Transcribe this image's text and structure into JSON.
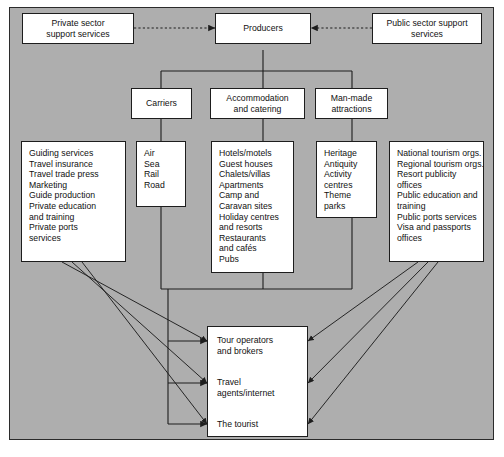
{
  "diagram": {
    "background_color": "#aeaeae",
    "box_fill": "#ffffff",
    "line_color": "#1d1d1d",
    "top": {
      "private_support": "Private sector\nsupport services",
      "private_support_lines": [
        "Private sector",
        "support services"
      ],
      "producers": "Producers",
      "public_support_lines": [
        "Public sector support",
        "services"
      ]
    },
    "sectors": {
      "carriers": "Carriers",
      "accommodation_lines": [
        "Accommodation",
        "and catering"
      ],
      "manmade_lines": [
        "Man-made",
        "attractions"
      ]
    },
    "columns": {
      "private_services": [
        "Guiding services",
        "Travel insurance",
        "Travel trade press",
        "Marketing",
        "Guide production",
        "Private education",
        "and training",
        "Private ports",
        "services"
      ],
      "carriers_modes": [
        "Air",
        "Sea",
        "Rail",
        "Road"
      ],
      "accommodation_items": [
        "Hotels/motels",
        "Guest houses",
        "Chalets/villas",
        "Apartments",
        "Camp and",
        "Caravan sites",
        "Holiday centres",
        "and resorts",
        "Restaurants",
        "and cafés",
        "Pubs"
      ],
      "attractions_items": [
        "Heritage",
        "Antiquity",
        "Activity",
        "centres",
        "Theme",
        "parks"
      ],
      "public_services": [
        "National tourism orgs.",
        "Regional tourism orgs.",
        "Resort publicity",
        "offices",
        "Public education and",
        "training",
        "Public ports services",
        "Visa and passports",
        "offices"
      ]
    },
    "bottom": {
      "tour_operators": [
        "Tour operators",
        "and brokers"
      ],
      "travel_agents": [
        "Travel",
        "agents/internet"
      ],
      "tourist": [
        "The tourist"
      ]
    }
  }
}
